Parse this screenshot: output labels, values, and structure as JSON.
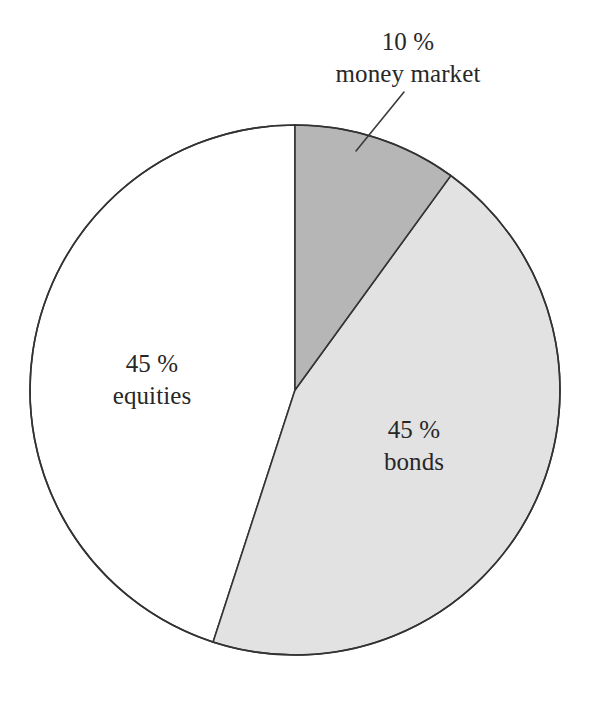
{
  "figure": {
    "title": "",
    "background_color": "#ffffff"
  },
  "labels": {
    "money_market": {
      "percent": "10 %",
      "name": "money market"
    },
    "equities": {
      "percent": "45 %",
      "name": "equities"
    },
    "bonds": {
      "percent": "45 %",
      "name": "bonds"
    }
  },
  "chart_data": {
    "type": "pie",
    "title": "",
    "xlabel": "",
    "ylabel": "",
    "legend_position": "none",
    "grid": false,
    "labels_inline": true,
    "total": 100,
    "units": "%",
    "start_angle_deg": 0,
    "direction": "clockwise",
    "center": {
      "x": 295,
      "y": 390
    },
    "radius": 265,
    "stroke_color": "#333333",
    "stroke_width": 1.6,
    "categories": [
      "money market",
      "bonds",
      "equities"
    ],
    "values": [
      10,
      45,
      45
    ],
    "slices": [
      {
        "label": "money market",
        "value": 10,
        "display_percent": "10 %",
        "color": "#b6b6b6",
        "start_angle_deg": 0,
        "end_angle_deg": 36,
        "label_placement": "outside",
        "leader_line": true
      },
      {
        "label": "bonds",
        "value": 45,
        "display_percent": "45 %",
        "color": "#e2e2e2",
        "start_angle_deg": 36,
        "end_angle_deg": 198,
        "label_placement": "inside",
        "leader_line": false
      },
      {
        "label": "equities",
        "value": 45,
        "display_percent": "45 %",
        "color": "#ffffff",
        "start_angle_deg": 198,
        "end_angle_deg": 360,
        "label_placement": "inside",
        "leader_line": false
      }
    ]
  }
}
